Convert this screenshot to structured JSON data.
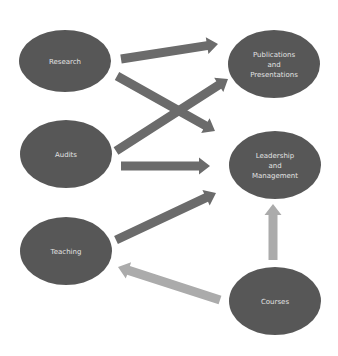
{
  "diagram": {
    "colors": {
      "node_fill": "#575757",
      "node_text": "#e2e2e2",
      "arrow_dark": "#6b6b6b",
      "arrow_light": "#ababab",
      "background": "#ffffff"
    },
    "nodes": [
      {
        "id": "research",
        "lines": [
          "Research"
        ],
        "cx": 65,
        "cy": 61,
        "rx": 46,
        "ry": 31
      },
      {
        "id": "publications",
        "lines": [
          "Publications",
          "and",
          "Presentations"
        ],
        "cx": 274,
        "cy": 64,
        "rx": 46,
        "ry": 34
      },
      {
        "id": "audits",
        "lines": [
          "Audits"
        ],
        "cx": 66,
        "cy": 154,
        "rx": 46,
        "ry": 34
      },
      {
        "id": "leadership",
        "lines": [
          "Leadership",
          "and",
          "Management"
        ],
        "cx": 275,
        "cy": 165,
        "rx": 46,
        "ry": 34
      },
      {
        "id": "teaching",
        "lines": [
          "Teaching"
        ],
        "cx": 66,
        "cy": 251,
        "rx": 46,
        "ry": 34
      },
      {
        "id": "courses",
        "lines": [
          "Courses"
        ],
        "cx": 275,
        "cy": 301,
        "rx": 46,
        "ry": 34
      }
    ],
    "edges": [
      {
        "from": "research",
        "to": "publications",
        "shade": "dark",
        "x1": 121,
        "y1": 59,
        "x2": 218,
        "y2": 44
      },
      {
        "from": "research",
        "to": "leadership",
        "shade": "dark",
        "x1": 117,
        "y1": 76,
        "x2": 215,
        "y2": 131
      },
      {
        "from": "audits",
        "to": "publications",
        "shade": "dark",
        "x1": 116,
        "y1": 151,
        "x2": 228,
        "y2": 79
      },
      {
        "from": "audits",
        "to": "leadership",
        "shade": "dark",
        "x1": 121,
        "y1": 166,
        "x2": 210,
        "y2": 166
      },
      {
        "from": "teaching",
        "to": "leadership",
        "shade": "dark",
        "x1": 116,
        "y1": 240,
        "x2": 216,
        "y2": 193
      },
      {
        "from": "courses",
        "to": "teaching",
        "shade": "light",
        "x1": 220,
        "y1": 300,
        "x2": 118,
        "y2": 267
      },
      {
        "from": "courses",
        "to": "leadership",
        "shade": "light",
        "x1": 273,
        "y1": 260,
        "x2": 273,
        "y2": 204
      }
    ]
  }
}
